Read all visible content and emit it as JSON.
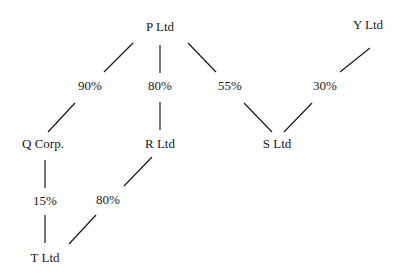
{
  "diagram": {
    "type": "ownership-structure",
    "nodes": [
      {
        "id": "P",
        "label": "P Ltd",
        "x": 160,
        "y": 31
      },
      {
        "id": "Y",
        "label": "Y Ltd",
        "x": 368,
        "y": 29
      },
      {
        "id": "Q",
        "label": "Q Corp.",
        "x": 43,
        "y": 148
      },
      {
        "id": "R",
        "label": "R Ltd",
        "x": 160,
        "y": 148
      },
      {
        "id": "S",
        "label": "S Ltd",
        "x": 277,
        "y": 148
      },
      {
        "id": "T",
        "label": "T Ltd",
        "x": 45,
        "y": 262
      }
    ],
    "edges": [
      {
        "from": "P",
        "to": "Q",
        "percent": "90%",
        "label_x": 90,
        "label_y": 90,
        "seg1": [
          133,
          43,
          104,
          72
        ],
        "seg2": [
          75,
          103,
          48,
          132
        ]
      },
      {
        "from": "P",
        "to": "R",
        "percent": "80%",
        "label_x": 160,
        "label_y": 90,
        "seg1": [
          160,
          45,
          160,
          73
        ],
        "seg2": [
          160,
          102,
          160,
          130
        ]
      },
      {
        "from": "P",
        "to": "S",
        "percent": "55%",
        "label_x": 230,
        "label_y": 90,
        "seg1": [
          188,
          43,
          216,
          72
        ],
        "seg2": [
          244,
          103,
          272,
          132
        ]
      },
      {
        "from": "Y",
        "to": "S",
        "percent": "30%",
        "label_x": 325,
        "label_y": 90,
        "seg1": [
          370,
          48,
          340,
          72
        ],
        "seg2": [
          312,
          103,
          284,
          132
        ]
      },
      {
        "from": "Q",
        "to": "T",
        "percent": "15%",
        "label_x": 45,
        "label_y": 205,
        "seg1": [
          45,
          160,
          45,
          188
        ],
        "seg2": [
          45,
          215,
          45,
          243
        ]
      },
      {
        "from": "R",
        "to": "T",
        "percent": "80%",
        "label_x": 108,
        "label_y": 204,
        "seg1": [
          152,
          157,
          124,
          186
        ],
        "seg2": [
          96,
          215,
          69,
          244
        ]
      }
    ]
  }
}
